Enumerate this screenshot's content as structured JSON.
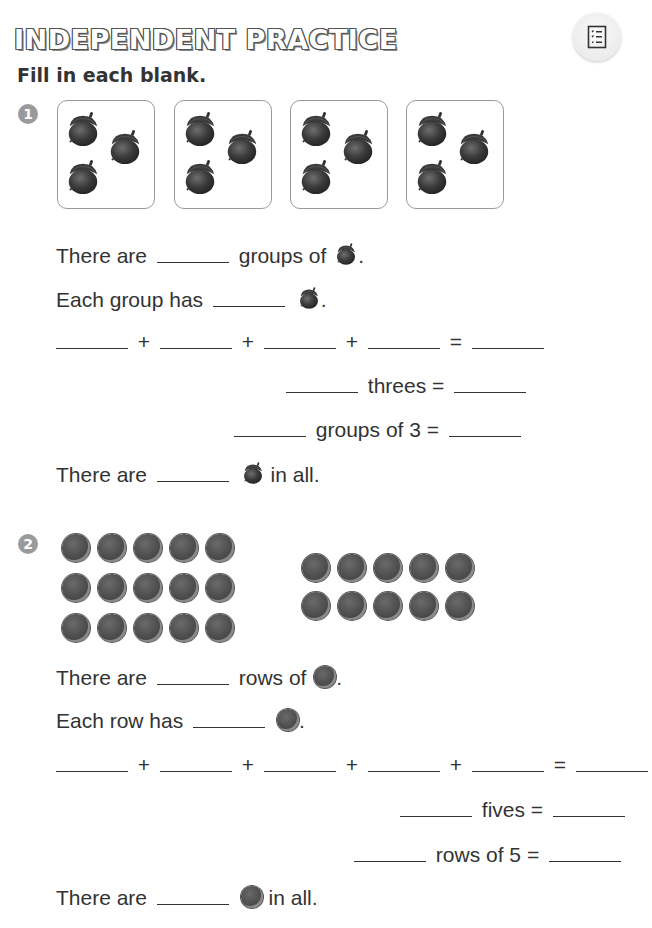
{
  "header": {
    "title": "INDEPENDENT PRACTICE",
    "instruction": "Fill in each blank.",
    "menu_icon": "checklist-icon"
  },
  "problems": [
    {
      "number": "1",
      "object_icon": "acorn-icon",
      "groups": [
        {
          "count": 3
        },
        {
          "count": 3
        },
        {
          "count": 3
        },
        {
          "count": 3
        }
      ],
      "lines": {
        "l1_pre": "There are",
        "l1_post": "groups of",
        "l1_end": ".",
        "l2_pre": "Each group has",
        "l2_end": ".",
        "plus": "+",
        "equals": "=",
        "l4_word": "threes =",
        "l5_word": "groups of 3 =",
        "l6_pre": "There are",
        "l6_post": "in all."
      },
      "blank_values": {
        "groups": "",
        "each_group": "",
        "addends": [
          "",
          "",
          "",
          ""
        ],
        "sum": "",
        "threes_count": "",
        "threes_total": "",
        "groups_of_3_count": "",
        "groups_of_3_total": "",
        "in_all": ""
      }
    },
    {
      "number": "2",
      "object_icon": "counter-dot-icon",
      "arrays": [
        {
          "rows": 3,
          "cols": 5
        },
        {
          "rows": 2,
          "cols": 5
        }
      ],
      "lines": {
        "l1_pre": "There are",
        "l1_post": "rows of",
        "l1_end": ".",
        "l2_pre": "Each row has",
        "l2_end": ".",
        "plus": "+",
        "equals": "=",
        "l4_word": "fives =",
        "l5_word": "rows of 5 =",
        "l6_pre": "There are",
        "l6_post": "in all."
      },
      "blank_values": {
        "rows": "",
        "each_row": "",
        "addends": [
          "",
          "",
          "",
          "",
          ""
        ],
        "sum": "",
        "fives_count": "",
        "fives_total": "",
        "rows_of_5_count": "",
        "rows_of_5_total": "",
        "in_all": ""
      }
    }
  ],
  "colors": {
    "title_outline": "#555555",
    "badge": "#9a9a9a",
    "box_border": "#9a9a9a",
    "text": "#333333"
  }
}
